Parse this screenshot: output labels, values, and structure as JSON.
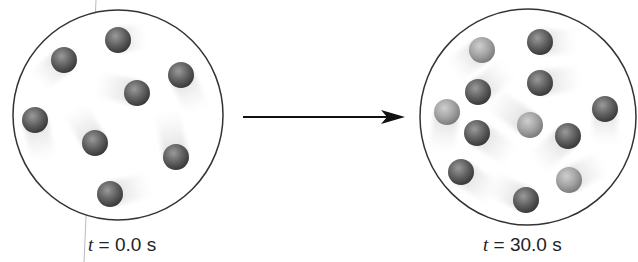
{
  "left": {
    "label_var": "t",
    "label_value": " = 0.0 s",
    "circle": {
      "cx": 118,
      "cy": 115,
      "r": 105
    },
    "balls": [
      {
        "x": 118,
        "y": 40,
        "shade": "dark",
        "tdx": 22,
        "tdy": -3
      },
      {
        "x": 64,
        "y": 60,
        "shade": "dark",
        "tdx": -22,
        "tdy": 18
      },
      {
        "x": 181,
        "y": 75,
        "shade": "dark",
        "tdx": 15,
        "tdy": 30
      },
      {
        "x": 137,
        "y": 93,
        "shade": "dark",
        "tdx": -35,
        "tdy": -8
      },
      {
        "x": 35,
        "y": 120,
        "shade": "dark",
        "tdx": 8,
        "tdy": 35
      },
      {
        "x": 95,
        "y": 143,
        "shade": "dark",
        "tdx": -18,
        "tdy": -30
      },
      {
        "x": 176,
        "y": 157,
        "shade": "dark",
        "tdx": -8,
        "tdy": -40
      },
      {
        "x": 110,
        "y": 194,
        "shade": "dark",
        "tdx": 35,
        "tdy": -8
      }
    ]
  },
  "right": {
    "label_var": "t",
    "label_value": " = 30.0 s",
    "circle": {
      "cx": 528,
      "cy": 117,
      "r": 108
    },
    "balls": [
      {
        "x": 482,
        "y": 50,
        "shade": "light",
        "tdx": -25,
        "tdy": 18
      },
      {
        "x": 540,
        "y": 42,
        "shade": "dark",
        "tdx": 30,
        "tdy": 0
      },
      {
        "x": 478,
        "y": 92,
        "shade": "dark",
        "tdx": 25,
        "tdy": -20
      },
      {
        "x": 540,
        "y": 83,
        "shade": "dark",
        "tdx": 35,
        "tdy": -5
      },
      {
        "x": 447,
        "y": 112,
        "shade": "light",
        "tdx": -5,
        "tdy": 35
      },
      {
        "x": 605,
        "y": 109,
        "shade": "dark",
        "tdx": 0,
        "tdy": 30
      },
      {
        "x": 530,
        "y": 125,
        "shade": "light",
        "tdx": -35,
        "tdy": -25
      },
      {
        "x": 477,
        "y": 133,
        "shade": "dark",
        "tdx": 30,
        "tdy": 20
      },
      {
        "x": 568,
        "y": 136,
        "shade": "dark",
        "tdx": -28,
        "tdy": 25
      },
      {
        "x": 461,
        "y": 172,
        "shade": "dark",
        "tdx": 30,
        "tdy": 20
      },
      {
        "x": 569,
        "y": 180,
        "shade": "light",
        "tdx": 30,
        "tdy": -15
      },
      {
        "x": 526,
        "y": 200,
        "shade": "dark",
        "tdx": -30,
        "tdy": -15
      }
    ]
  },
  "arrow": {
    "x1": 243,
    "y1": 117,
    "x2": 405,
    "y2": 117
  },
  "colors": {
    "dark": "#5a5a5a",
    "light": "#9a9a9a",
    "outline": "#333333"
  }
}
